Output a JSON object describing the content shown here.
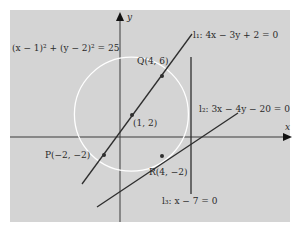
{
  "diagram": {
    "axes": {
      "x_label": "x",
      "y_label": "y"
    },
    "circle": {
      "equation": "(x − 1)² + (y − 2)² = 25",
      "center": [
        1,
        2
      ],
      "radius": 5,
      "center_label": "(1, 2)"
    },
    "points": [
      {
        "name": "P",
        "label": "P(−2, −2)",
        "x": -2,
        "y": -2
      },
      {
        "name": "Q",
        "label": "Q(4, 6)",
        "x": 4,
        "y": 6
      },
      {
        "name": "R",
        "label": "R(4, −2)",
        "x": 4,
        "y": -2
      }
    ],
    "lines": [
      {
        "name": "l1",
        "label": "l₁: 4x − 3y + 2 = 0"
      },
      {
        "name": "l2",
        "label": "l₂: 3x − 4y − 20 = 0"
      },
      {
        "name": "l3",
        "label": "l₃: x − 7 = 0"
      }
    ],
    "colors": {
      "panel": "#d4d4d4",
      "ink": "#2e2e2e",
      "circle": "#ffffff"
    }
  }
}
